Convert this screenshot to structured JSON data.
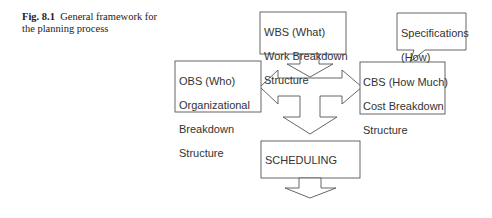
{
  "caption": {
    "label": "Fig. 8.1",
    "text": "General framework for the planning process"
  },
  "diagram": {
    "wbs": {
      "line1": "WBS (What)",
      "line2": "Work Breakdown",
      "line3": "Structure"
    },
    "obs": {
      "line1": "OBS (Who)",
      "line2": "Organizational",
      "line3": "Breakdown",
      "line4": "Structure"
    },
    "cbs": {
      "line1": "CBS (How Much)",
      "line2": "Cost Breakdown",
      "line3": "Structure"
    },
    "specifications": {
      "line1": "Specifications",
      "line2": "(How)"
    },
    "scheduling": {
      "label": "SCHEDULING"
    }
  }
}
